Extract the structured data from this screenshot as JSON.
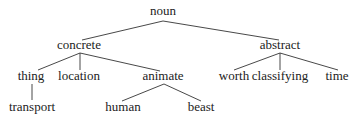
{
  "diagram": {
    "type": "tree",
    "nodes": [
      {
        "id": "noun",
        "label": "noun",
        "x": 163,
        "y": 15
      },
      {
        "id": "concrete",
        "label": "concrete",
        "x": 79,
        "y": 49
      },
      {
        "id": "abstract",
        "label": "abstract",
        "x": 280,
        "y": 49
      },
      {
        "id": "thing",
        "label": "thing",
        "x": 31,
        "y": 80
      },
      {
        "id": "location",
        "label": "location",
        "x": 79,
        "y": 80
      },
      {
        "id": "animate",
        "label": "animate",
        "x": 163,
        "y": 80
      },
      {
        "id": "worth",
        "label": "worth",
        "x": 234,
        "y": 80
      },
      {
        "id": "classifying",
        "label": "classifying",
        "x": 280,
        "y": 80
      },
      {
        "id": "time",
        "label": "time",
        "x": 337,
        "y": 80
      },
      {
        "id": "transport",
        "label": "transport",
        "x": 32,
        "y": 111
      },
      {
        "id": "human",
        "label": "human",
        "x": 123,
        "y": 111
      },
      {
        "id": "beast",
        "label": "beast",
        "x": 201,
        "y": 111
      }
    ],
    "edges": [
      {
        "from": "noun",
        "to": "concrete",
        "x1": 163,
        "y1": 21,
        "x2": 82,
        "y2": 40
      },
      {
        "from": "noun",
        "to": "abstract",
        "x1": 163,
        "y1": 21,
        "x2": 279,
        "y2": 40
      },
      {
        "from": "concrete",
        "to": "thing",
        "x1": 80,
        "y1": 53,
        "x2": 38,
        "y2": 70
      },
      {
        "from": "concrete",
        "to": "location",
        "x1": 80,
        "y1": 53,
        "x2": 80,
        "y2": 70
      },
      {
        "from": "concrete",
        "to": "animate",
        "x1": 80,
        "y1": 53,
        "x2": 160,
        "y2": 71
      },
      {
        "from": "abstract",
        "to": "worth",
        "x1": 280,
        "y1": 53,
        "x2": 234,
        "y2": 70
      },
      {
        "from": "abstract",
        "to": "classifying",
        "x1": 280,
        "y1": 53,
        "x2": 280,
        "y2": 70
      },
      {
        "from": "abstract",
        "to": "time",
        "x1": 280,
        "y1": 53,
        "x2": 338,
        "y2": 70
      },
      {
        "from": "thing",
        "to": "transport",
        "x1": 32,
        "y1": 84,
        "x2": 32,
        "y2": 100
      },
      {
        "from": "animate",
        "to": "human",
        "x1": 164,
        "y1": 84,
        "x2": 122,
        "y2": 101
      },
      {
        "from": "animate",
        "to": "beast",
        "x1": 164,
        "y1": 84,
        "x2": 201,
        "y2": 101
      }
    ]
  }
}
